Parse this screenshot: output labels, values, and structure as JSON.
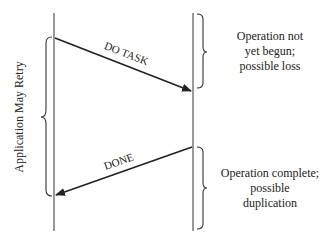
{
  "diagram": {
    "type": "sequence",
    "colors": {
      "line": "#333333",
      "text": "#222222",
      "background": "#ffffff"
    },
    "retry_label": "Application May Retry",
    "messages": [
      {
        "label": "DO TASK",
        "from": "left",
        "to": "right"
      },
      {
        "label": "DONE",
        "from": "right",
        "to": "left"
      }
    ],
    "annotations": [
      {
        "lines": [
          "Operation not",
          "yet begun;",
          "possible loss"
        ]
      },
      {
        "lines": [
          "Operation complete;",
          "possible",
          "duplication"
        ]
      }
    ]
  }
}
